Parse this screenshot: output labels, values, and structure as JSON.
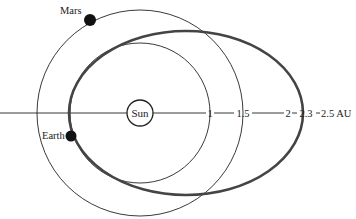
{
  "diagram": {
    "sun_label": "Sun",
    "earth_label": "Earth",
    "mars_label": "Mars",
    "axis_ticks": [
      {
        "label": "1",
        "x": 210
      },
      {
        "label": "1.5",
        "x": 243
      },
      {
        "label": "2",
        "x": 288
      },
      {
        "label": "2.3",
        "x": 306
      },
      {
        "label": "2.5 AU",
        "x": 335
      }
    ],
    "colors": {
      "line": "#222222",
      "transfer_orbit": "#444444",
      "background": "#ffffff"
    }
  }
}
